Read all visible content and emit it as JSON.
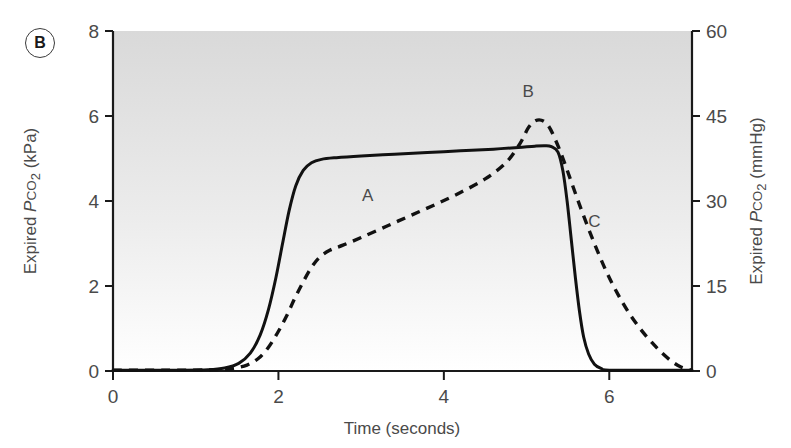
{
  "panel": {
    "label": "B"
  },
  "chart_data": {
    "type": "line",
    "title": "",
    "xlabel": "Time (seconds)",
    "ylabel": "Expired PCO2 (kPa)",
    "ylabel_parts": {
      "prefix": "Expired ",
      "italic": "P",
      "smallcaps": "CO",
      "sub": "2",
      "suffix": " (kPa)"
    },
    "y2label": "Expired PCO2 (mmHg)",
    "y2label_parts": {
      "prefix": "Expired ",
      "italic": "P",
      "smallcaps": "CO",
      "sub": "2",
      "suffix": " (mmHg)"
    },
    "xlim": [
      0,
      7
    ],
    "ylim": [
      0,
      8
    ],
    "y2lim": [
      0,
      60
    ],
    "xticks": [
      0,
      2,
      4,
      6
    ],
    "xticklabels": [
      "0",
      "2",
      "4",
      "6"
    ],
    "yticks": [
      0,
      2,
      4,
      6,
      8
    ],
    "yticklabels": [
      "0",
      "2",
      "4",
      "6",
      "8"
    ],
    "y2ticks": [
      0,
      15,
      30,
      45,
      60
    ],
    "y2ticklabels": [
      "0",
      "15",
      "30",
      "45",
      "60"
    ],
    "grid": false,
    "legend": "none",
    "background": "vertical gradient light-grey to white",
    "annotations": [
      {
        "text": "A",
        "x": 3.08,
        "y": 4.0
      },
      {
        "text": "B",
        "x": 5.02,
        "y": 6.45
      },
      {
        "text": "C",
        "x": 5.82,
        "y": 3.4
      }
    ],
    "series": [
      {
        "name": "normal capnogram",
        "style": "solid",
        "points": [
          [
            0.0,
            0.02
          ],
          [
            0.8,
            0.02
          ],
          [
            1.15,
            0.03
          ],
          [
            1.35,
            0.07
          ],
          [
            1.52,
            0.18
          ],
          [
            1.66,
            0.42
          ],
          [
            1.78,
            0.85
          ],
          [
            1.88,
            1.45
          ],
          [
            1.97,
            2.2
          ],
          [
            2.05,
            3.0
          ],
          [
            2.13,
            3.78
          ],
          [
            2.21,
            4.36
          ],
          [
            2.3,
            4.72
          ],
          [
            2.4,
            4.9
          ],
          [
            2.52,
            4.98
          ],
          [
            2.7,
            5.02
          ],
          [
            3.0,
            5.06
          ],
          [
            3.4,
            5.1
          ],
          [
            3.8,
            5.14
          ],
          [
            4.2,
            5.18
          ],
          [
            4.6,
            5.22
          ],
          [
            4.9,
            5.26
          ],
          [
            5.1,
            5.29
          ],
          [
            5.22,
            5.3
          ],
          [
            5.3,
            5.28
          ],
          [
            5.38,
            5.15
          ],
          [
            5.44,
            4.7
          ],
          [
            5.49,
            4.0
          ],
          [
            5.54,
            3.1
          ],
          [
            5.59,
            2.2
          ],
          [
            5.64,
            1.4
          ],
          [
            5.69,
            0.8
          ],
          [
            5.75,
            0.4
          ],
          [
            5.82,
            0.16
          ],
          [
            5.9,
            0.06
          ],
          [
            6.0,
            0.02
          ],
          [
            6.6,
            0.02
          ],
          [
            7.0,
            0.02
          ]
        ]
      },
      {
        "name": "obstructive capnogram",
        "style": "dashed",
        "points": [
          [
            0.0,
            0.02
          ],
          [
            0.9,
            0.02
          ],
          [
            1.25,
            0.03
          ],
          [
            1.45,
            0.06
          ],
          [
            1.62,
            0.14
          ],
          [
            1.76,
            0.3
          ],
          [
            1.88,
            0.56
          ],
          [
            1.99,
            0.9
          ],
          [
            2.1,
            1.3
          ],
          [
            2.2,
            1.72
          ],
          [
            2.3,
            2.1
          ],
          [
            2.4,
            2.44
          ],
          [
            2.5,
            2.68
          ],
          [
            2.62,
            2.84
          ],
          [
            2.78,
            2.96
          ],
          [
            3.0,
            3.14
          ],
          [
            3.3,
            3.4
          ],
          [
            3.6,
            3.66
          ],
          [
            3.9,
            3.92
          ],
          [
            4.2,
            4.2
          ],
          [
            4.5,
            4.52
          ],
          [
            4.75,
            4.9
          ],
          [
            4.92,
            5.35
          ],
          [
            5.02,
            5.72
          ],
          [
            5.1,
            5.88
          ],
          [
            5.18,
            5.9
          ],
          [
            5.26,
            5.78
          ],
          [
            5.34,
            5.48
          ],
          [
            5.44,
            5.0
          ],
          [
            5.55,
            4.4
          ],
          [
            5.68,
            3.7
          ],
          [
            5.82,
            3.0
          ],
          [
            5.96,
            2.36
          ],
          [
            6.1,
            1.82
          ],
          [
            6.24,
            1.36
          ],
          [
            6.38,
            0.98
          ],
          [
            6.52,
            0.66
          ],
          [
            6.64,
            0.42
          ],
          [
            6.76,
            0.22
          ],
          [
            6.86,
            0.1
          ],
          [
            6.95,
            0.04
          ],
          [
            7.0,
            0.02
          ]
        ]
      }
    ]
  }
}
